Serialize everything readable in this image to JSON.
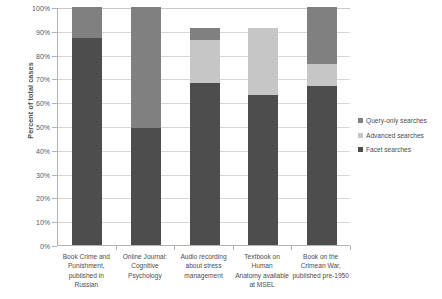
{
  "chart_data": {
    "type": "bar",
    "subtype": "stacked-bar-percent",
    "title": "",
    "xlabel": "",
    "ylabel": "Percent of total cases",
    "ylim": [
      0,
      100
    ],
    "y_ticks": [
      "0%",
      "10%",
      "20%",
      "30%",
      "40%",
      "50%",
      "60%",
      "70%",
      "80%",
      "90%",
      "100%"
    ],
    "grid": true,
    "legend_position": "right",
    "categories": [
      "Book Crime and Punishment, published in Russian",
      "Online Journal: Cognitive Psychology",
      "Audio recording about stress management",
      "Textbook on Human Anatomy available at MSEL",
      "Book on the Crimean War, published pre-1950"
    ],
    "category_lines": [
      [
        "Book Crime and",
        "Punishment,",
        "published in Russian"
      ],
      [
        "Online Journal:",
        "Cognitive",
        "Psychology"
      ],
      [
        "Audio recording",
        "about stress",
        "management"
      ],
      [
        "Textbook on Human",
        "Anatomy available",
        "at MSEL"
      ],
      [
        "Book on the",
        "Crimean War,",
        "published pre-1950"
      ]
    ],
    "series": [
      {
        "name": "Facet searches",
        "color": "#4d4d4d",
        "values": [
          87,
          49,
          68,
          63,
          67
        ]
      },
      {
        "name": "Advanced searches",
        "color": "#c6c6c6",
        "values": [
          0,
          0,
          18,
          28,
          9
        ]
      },
      {
        "name": "Query-only searches",
        "color": "#808080",
        "values": [
          13,
          51,
          5,
          0,
          24
        ]
      }
    ],
    "totals": [
      100,
      100,
      91,
      91,
      100
    ]
  },
  "legend": {
    "items": [
      {
        "label": "Query-only searches",
        "color": "#808080"
      },
      {
        "label": "Advanced searches",
        "color": "#c6c6c6"
      },
      {
        "label": "Facet searches",
        "color": "#4d4d4d"
      }
    ]
  }
}
